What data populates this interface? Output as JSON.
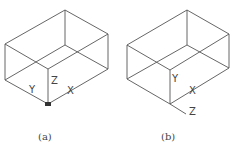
{
  "figures": [
    {
      "id": "a",
      "caption": "(a)",
      "axes": {
        "x": "X",
        "y": "Y",
        "z": "Z"
      },
      "origin_marker": true
    },
    {
      "id": "b",
      "caption": "(b)",
      "axes": {
        "x": "X",
        "y": "Y",
        "z": "Z"
      },
      "origin_marker": false
    }
  ],
  "colors": {
    "line": "#555555",
    "background": "#ffffff"
  }
}
